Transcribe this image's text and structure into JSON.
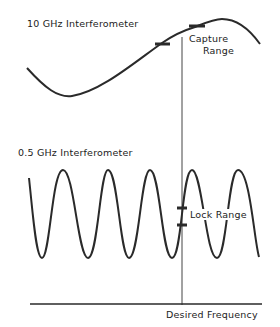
{
  "diagram": {
    "top_label": "10 GHz Interferometer",
    "capture_label_line1": "Capture",
    "capture_label_line2": "Range",
    "bottom_label": "0.5 GHz Interferometer",
    "lock_label": "Lock Range",
    "axis_label": "Desired Frequency",
    "colors": {
      "line": "#2a2a2a",
      "background": "#ffffff"
    }
  }
}
